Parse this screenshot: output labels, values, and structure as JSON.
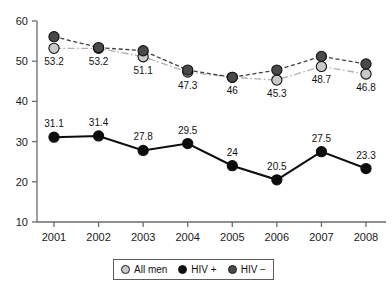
{
  "chart_data": {
    "type": "line",
    "title": "",
    "subtitle": "",
    "xlabel": "",
    "ylabel": "",
    "categories": [
      "2001",
      "2002",
      "2003",
      "2004",
      "2005",
      "2006",
      "2007",
      "2008"
    ],
    "ylim": [
      10,
      60
    ],
    "yticks": [
      10,
      20,
      30,
      40,
      50,
      60
    ],
    "grid": false,
    "legend_position": "bottom",
    "series": [
      {
        "name": "All men",
        "color": "#c9c9c9",
        "line_style": "dash-dot",
        "marker": "circle",
        "values": [
          53.2,
          53.2,
          51.1,
          47.3,
          46,
          45.3,
          48.7,
          46.8
        ],
        "labels": [
          "53.2",
          "53.2",
          "51.1",
          "47.3",
          "46",
          "45.3",
          "48.7",
          "46.8"
        ]
      },
      {
        "name": "HIV +",
        "color": "#0d0d0d",
        "line_style": "solid",
        "marker": "circle",
        "values": [
          31.1,
          31.4,
          27.8,
          29.5,
          24,
          20.5,
          27.5,
          23.3
        ],
        "labels": [
          "31.1",
          "31.4",
          "27.8",
          "29.5",
          "24",
          "20.5",
          "27.5",
          "23.3"
        ]
      },
      {
        "name": "HIV −",
        "color": "#4a4a4a",
        "line_style": "dashed",
        "marker": "circle",
        "values": [
          56.1,
          53.4,
          52.6,
          47.8,
          46.0,
          47.8,
          51.2,
          49.3
        ],
        "labels": [
          "",
          "",
          "",
          "",
          "",
          "",
          "",
          ""
        ]
      }
    ]
  },
  "legend": {
    "items": [
      {
        "label": "All men",
        "color": "#c9c9c9"
      },
      {
        "label": "HIV +",
        "color": "#0d0d0d"
      },
      {
        "label": "HIV −",
        "color": "#4a4a4a"
      }
    ]
  },
  "axis": {
    "y_tick_labels": [
      "60",
      "50",
      "40",
      "30",
      "20",
      "10"
    ],
    "x_tick_labels": [
      "2001",
      "2002",
      "2003",
      "2004",
      "2005",
      "2006",
      "2007",
      "2008"
    ]
  }
}
